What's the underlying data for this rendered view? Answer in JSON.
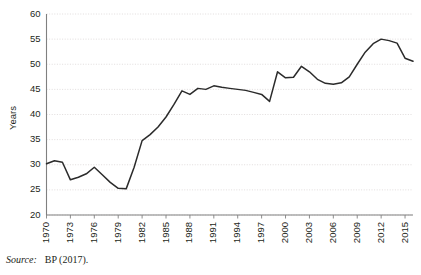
{
  "source": {
    "label": "Source:",
    "text": "BP (2017)."
  },
  "chart_data": {
    "type": "line",
    "title": "",
    "xlabel": "",
    "ylabel": "Years",
    "ylim": [
      20,
      60
    ],
    "ytick_values": [
      20,
      25,
      30,
      35,
      40,
      45,
      50,
      55,
      60
    ],
    "ytick_labels": [
      "20",
      "25",
      "30",
      "35",
      "40",
      "45",
      "50",
      "55",
      "60"
    ],
    "xlim": [
      1970,
      2016
    ],
    "xtick_labels": [
      "1970",
      "1973",
      "1976",
      "1979",
      "1982",
      "1985",
      "1988",
      "1991",
      "1994",
      "1997",
      "2000",
      "2003",
      "2006",
      "2009",
      "2012",
      "2015"
    ],
    "xtick_values": [
      1970,
      1973,
      1976,
      1979,
      1982,
      1985,
      1988,
      1991,
      1994,
      1997,
      2000,
      2003,
      2006,
      2009,
      2012,
      2015
    ],
    "grid": "horizontal-dotted",
    "legend": "none",
    "line_color": "#2b2b2b",
    "x": [
      1970,
      1971,
      1972,
      1973,
      1974,
      1975,
      1976,
      1977,
      1978,
      1979,
      1980,
      1981,
      1982,
      1983,
      1984,
      1985,
      1986,
      1987,
      1988,
      1989,
      1990,
      1991,
      1992,
      1993,
      1994,
      1995,
      1996,
      1997,
      1998,
      1999,
      2000,
      2001,
      2002,
      2003,
      2004,
      2005,
      2006,
      2007,
      2008,
      2009,
      2010,
      2011,
      2012,
      2013,
      2014,
      2015,
      2016
    ],
    "values": [
      30.2,
      30.8,
      30.5,
      27.0,
      27.5,
      28.2,
      29.5,
      28.0,
      26.5,
      25.3,
      25.2,
      29.5,
      34.8,
      36.0,
      37.5,
      39.5,
      42.0,
      44.7,
      44.0,
      45.2,
      45.0,
      45.7,
      45.4,
      45.2,
      45.0,
      44.8,
      44.4,
      44.0,
      42.6,
      48.5,
      47.3,
      47.4,
      49.6,
      48.5,
      47.0,
      46.2,
      46.0,
      46.3,
      47.5,
      50.0,
      52.4,
      54.1,
      55.0,
      54.7,
      54.2,
      51.2,
      50.6
    ]
  },
  "axis": {
    "ylabel_text": "Years"
  }
}
